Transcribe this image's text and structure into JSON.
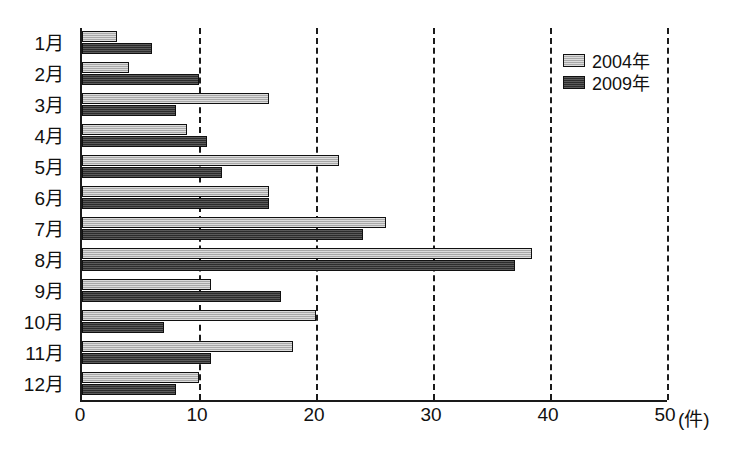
{
  "chart_data": {
    "type": "bar",
    "orientation": "horizontal",
    "title": "",
    "xlabel": "(件)",
    "ylabel": "",
    "xlim": [
      0,
      50
    ],
    "xticks": [
      "0",
      "10",
      "20",
      "30",
      "40",
      "50"
    ],
    "xtick_values": [
      0,
      10,
      20,
      30,
      40,
      50
    ],
    "grid": true,
    "grid_style": "dashed-vertical",
    "legend_position": "top-right",
    "categories": [
      "1月",
      "2月",
      "3月",
      "4月",
      "5月",
      "6月",
      "7月",
      "8月",
      "9月",
      "10月",
      "11月",
      "12月"
    ],
    "series": [
      {
        "name": "2004年",
        "color": "#b2b2b2",
        "values": [
          3,
          4,
          16,
          9,
          22,
          16,
          26,
          38.5,
          11,
          20,
          18,
          10
        ]
      },
      {
        "name": "2009年",
        "color": "#3b3b3b",
        "values": [
          6,
          10,
          8,
          10.7,
          12,
          16,
          24,
          37,
          17,
          7,
          11,
          8
        ]
      }
    ]
  },
  "axis_unit": "(件)",
  "legend": {
    "items": [
      {
        "label": "2004年",
        "swatch": "light-gray-swatch"
      },
      {
        "label": "2009年",
        "swatch": "dark-gray-swatch"
      }
    ]
  }
}
